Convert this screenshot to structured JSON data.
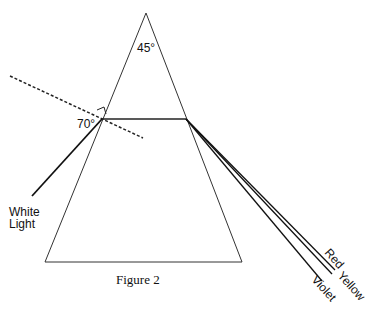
{
  "figure": {
    "caption": "Figure 2",
    "apex_angle": "45°",
    "incidence_angle": "70°",
    "incident_label_line1": "White",
    "incident_label_line2": "Light",
    "rays": [
      {
        "name": "Red",
        "label": "Red"
      },
      {
        "name": "Yellow",
        "label": "Yellow"
      },
      {
        "name": "Violet",
        "label": "Violet"
      }
    ]
  }
}
